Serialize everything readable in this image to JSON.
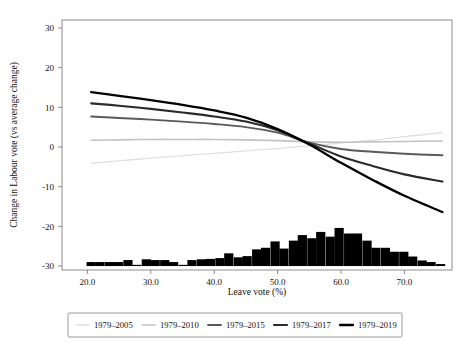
{
  "chart_data": {
    "type": "line",
    "title": "",
    "xlabel": "Leave vote (%)",
    "ylabel": "Change in Labour vote (vs average change)",
    "xlim": [
      16.0,
      77.5
    ],
    "ylim": [
      -31.0,
      32.0
    ],
    "xticks": [
      "20.0",
      "30.0",
      "40.0",
      "50.0",
      "60.0",
      "70.0"
    ],
    "xtick_values": [
      20,
      30,
      40,
      50,
      60,
      70
    ],
    "yticks": [
      "30",
      "20",
      "10",
      "0",
      "-10",
      "-20",
      "-30"
    ],
    "ytick_values": [
      30,
      20,
      10,
      0,
      -10,
      -20,
      -30
    ],
    "grid": false,
    "legend_position": "bottom-outside",
    "series": [
      {
        "name": "1979-2005",
        "color": "#e0e0e0",
        "width": 1.3,
        "x": [
          20.6,
          25.0,
          30.0,
          35.0,
          40.0,
          45.0,
          50.0,
          55.0,
          60.0,
          65.0,
          70.0,
          76.0
        ],
        "y": [
          -4.1,
          -3.5,
          -2.8,
          -2.2,
          -1.6,
          -1.0,
          -0.4,
          0.3,
          1.0,
          1.7,
          2.6,
          3.6
        ]
      },
      {
        "name": "1979-2010",
        "color": "#c2c2c2",
        "width": 1.6,
        "x": [
          20.6,
          25.0,
          30.0,
          35.0,
          40.0,
          45.0,
          50.0,
          55.0,
          60.0,
          65.0,
          70.0,
          76.0
        ],
        "y": [
          1.7,
          1.8,
          1.9,
          1.9,
          1.9,
          1.8,
          1.6,
          1.3,
          1.2,
          1.3,
          1.4,
          1.5
        ]
      },
      {
        "name": "1979-2015",
        "color": "#5a5a5a",
        "width": 1.9,
        "x": [
          20.6,
          25.0,
          30.0,
          35.0,
          40.0,
          45.0,
          50.0,
          55.0,
          60.0,
          65.0,
          70.0,
          76.0
        ],
        "y": [
          7.7,
          7.3,
          6.9,
          6.4,
          5.8,
          5.0,
          3.6,
          1.1,
          -0.5,
          -1.2,
          -1.7,
          -2.1
        ]
      },
      {
        "name": "1979-2017",
        "color": "#2b2b2b",
        "width": 2.1,
        "x": [
          20.6,
          25.0,
          30.0,
          35.0,
          40.0,
          45.0,
          50.0,
          55.0,
          60.0,
          65.0,
          70.0,
          76.0
        ],
        "y": [
          11.0,
          10.4,
          9.6,
          8.7,
          7.7,
          6.4,
          4.2,
          0.9,
          -2.4,
          -4.8,
          -6.9,
          -8.7
        ]
      },
      {
        "name": "1979-2019",
        "color": "#000000",
        "width": 2.3,
        "x": [
          20.6,
          25.0,
          30.0,
          35.0,
          40.0,
          45.0,
          50.0,
          55.0,
          60.0,
          65.0,
          70.0,
          76.0
        ],
        "y": [
          13.8,
          12.9,
          11.8,
          10.6,
          9.2,
          7.4,
          4.5,
          0.6,
          -4.0,
          -8.3,
          -12.3,
          -16.4
        ]
      }
    ],
    "histogram": {
      "name": "leave-vote-distribution",
      "baseline": -30.0,
      "color": "#000000",
      "bin_width": 1.45,
      "bins": [
        {
          "x": 20.6,
          "h": 1.0
        },
        {
          "x": 22.0,
          "h": 1.0
        },
        {
          "x": 23.5,
          "h": 1.0
        },
        {
          "x": 24.9,
          "h": 1.0
        },
        {
          "x": 26.4,
          "h": 1.5
        },
        {
          "x": 27.8,
          "h": 0.3
        },
        {
          "x": 29.3,
          "h": 1.7
        },
        {
          "x": 30.7,
          "h": 1.5
        },
        {
          "x": 32.2,
          "h": 1.5
        },
        {
          "x": 33.6,
          "h": 1.0
        },
        {
          "x": 35.1,
          "h": 0.3
        },
        {
          "x": 36.5,
          "h": 1.5
        },
        {
          "x": 38.0,
          "h": 1.7
        },
        {
          "x": 39.4,
          "h": 1.8
        },
        {
          "x": 40.9,
          "h": 2.0
        },
        {
          "x": 42.3,
          "h": 3.2
        },
        {
          "x": 43.8,
          "h": 2.2
        },
        {
          "x": 45.2,
          "h": 2.5
        },
        {
          "x": 46.7,
          "h": 4.2
        },
        {
          "x": 48.1,
          "h": 4.6
        },
        {
          "x": 49.6,
          "h": 6.2
        },
        {
          "x": 51.0,
          "h": 4.4
        },
        {
          "x": 52.5,
          "h": 6.4
        },
        {
          "x": 53.9,
          "h": 7.8
        },
        {
          "x": 55.4,
          "h": 7.0
        },
        {
          "x": 56.8,
          "h": 8.6
        },
        {
          "x": 58.3,
          "h": 7.4
        },
        {
          "x": 59.7,
          "h": 9.6
        },
        {
          "x": 61.2,
          "h": 8.2
        },
        {
          "x": 62.6,
          "h": 8.2
        },
        {
          "x": 64.1,
          "h": 6.4
        },
        {
          "x": 65.5,
          "h": 4.6
        },
        {
          "x": 67.0,
          "h": 4.6
        },
        {
          "x": 68.4,
          "h": 3.6
        },
        {
          "x": 69.9,
          "h": 3.6
        },
        {
          "x": 71.3,
          "h": 2.4
        },
        {
          "x": 72.8,
          "h": 1.4
        },
        {
          "x": 74.2,
          "h": 1.0
        },
        {
          "x": 75.7,
          "h": 0.5
        }
      ]
    }
  },
  "legend": {
    "items": [
      {
        "label": "1979–2005"
      },
      {
        "label": "1979–2010"
      },
      {
        "label": "1979–2015"
      },
      {
        "label": "1979–2017"
      },
      {
        "label": "1979–2019"
      }
    ]
  },
  "axes": {
    "x_title": "Leave vote (%)",
    "y_title": "Change in Labour vote (vs average change)"
  }
}
